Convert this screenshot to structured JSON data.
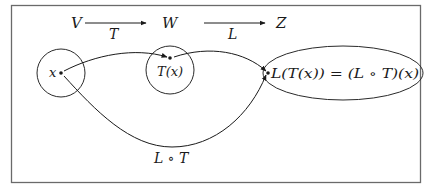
{
  "diagram": {
    "type": "function-composition",
    "top_row": {
      "spaces": [
        "V",
        "W",
        "Z"
      ],
      "maps": [
        {
          "from": "V",
          "to": "W",
          "label": "T"
        },
        {
          "from": "W",
          "to": "Z",
          "label": "L"
        }
      ]
    },
    "nodes": [
      {
        "id": "domain-V",
        "shape": "circle",
        "point_label": "x"
      },
      {
        "id": "codomain-W",
        "shape": "circle",
        "point_label": "T(x)"
      },
      {
        "id": "codomain-Z",
        "shape": "ellipse",
        "point_label": "L(T(x)) = (L ∘ T)(x)"
      }
    ],
    "edges": [
      {
        "from": "x",
        "to": "T(x)",
        "label": ""
      },
      {
        "from": "T(x)",
        "to": "L(T(x))",
        "label": ""
      },
      {
        "from": "x",
        "to": "L(T(x))",
        "label": "L ∘ T"
      }
    ],
    "labels": {
      "V": "V",
      "W": "W",
      "Z": "Z",
      "T": "T",
      "L": "L",
      "x": "x",
      "Tx": "T(x)",
      "result": "L(T(x)) = (L ∘ T)(x)",
      "composition": "L ∘ T"
    },
    "colors": {
      "stroke": "#2a2a2a",
      "frame": "#6a6a6a",
      "background": "#ffffff"
    }
  }
}
